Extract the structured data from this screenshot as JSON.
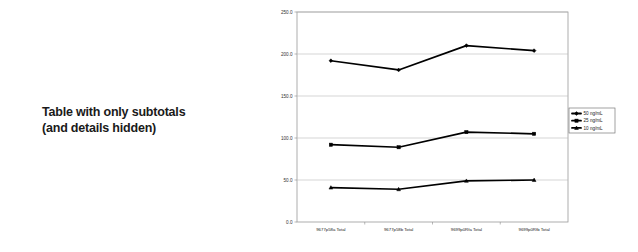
{
  "caption": {
    "line1": "Table with only subtotals",
    "line2": "(and details hidden)"
  },
  "chart_data": {
    "type": "line",
    "title": "",
    "xlabel": "",
    "ylabel": "",
    "ylim": [
      0.0,
      250.0
    ],
    "yticks": [
      "0.0",
      "50.0",
      "100.0",
      "150.0",
      "200.0",
      "250.0"
    ],
    "ytick_values": [
      0.0,
      50.0,
      100.0,
      150.0,
      200.0,
      250.0
    ],
    "grid": true,
    "legend_position": "right-outside",
    "categories": [
      "9677p58a Total",
      "9677p58b Total",
      "9699p0Rfa Total",
      "9699p0Rfb Total"
    ],
    "series": [
      {
        "name": "50 ng/mL",
        "values": [
          192.0,
          181.0,
          210.0,
          204.0
        ],
        "color": "#000000",
        "marker": "diamond"
      },
      {
        "name": "25 ng/mL",
        "values": [
          92.0,
          89.0,
          107.0,
          105.0
        ],
        "color": "#000000",
        "marker": "square"
      },
      {
        "name": "10 ng/mL",
        "values": [
          41.0,
          39.0,
          49.0,
          50.0
        ],
        "color": "#000000",
        "marker": "triangle"
      }
    ]
  },
  "legend": {
    "entries": [
      "50 ng/mL",
      "25 ng/mL",
      "10 ng/mL"
    ]
  }
}
